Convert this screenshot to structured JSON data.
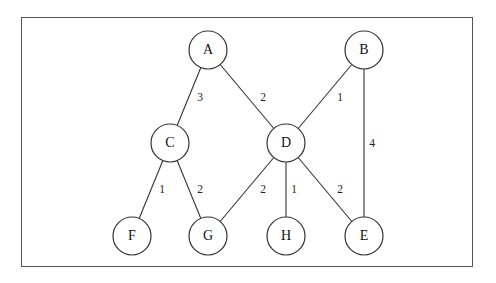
{
  "diagram": {
    "type": "weighted-undirected-graph",
    "nodes": [
      {
        "id": "A",
        "label": "A",
        "x": 208,
        "y": 50
      },
      {
        "id": "B",
        "label": "B",
        "x": 364,
        "y": 50
      },
      {
        "id": "C",
        "label": "C",
        "x": 170,
        "y": 143
      },
      {
        "id": "D",
        "label": "D",
        "x": 286,
        "y": 143
      },
      {
        "id": "F",
        "label": "F",
        "x": 132,
        "y": 236
      },
      {
        "id": "G",
        "label": "G",
        "x": 208,
        "y": 236
      },
      {
        "id": "H",
        "label": "H",
        "x": 286,
        "y": 236
      },
      {
        "id": "E",
        "label": "E",
        "x": 364,
        "y": 236
      }
    ],
    "edges": [
      {
        "from": "A",
        "to": "C",
        "weight": "3",
        "lx": 200,
        "ly": 98
      },
      {
        "from": "A",
        "to": "D",
        "weight": "2",
        "lx": 263,
        "ly": 98
      },
      {
        "from": "B",
        "to": "D",
        "weight": "1",
        "lx": 340,
        "ly": 98
      },
      {
        "from": "B",
        "to": "E",
        "weight": "4",
        "lx": 372,
        "ly": 144
      },
      {
        "from": "C",
        "to": "F",
        "weight": "1",
        "lx": 162,
        "ly": 190
      },
      {
        "from": "C",
        "to": "G",
        "weight": "2",
        "lx": 200,
        "ly": 190
      },
      {
        "from": "D",
        "to": "G",
        "weight": "2",
        "lx": 263,
        "ly": 190
      },
      {
        "from": "D",
        "to": "H",
        "weight": "1",
        "lx": 294,
        "ly": 190
      },
      {
        "from": "D",
        "to": "E",
        "weight": "2",
        "lx": 340,
        "ly": 190
      }
    ],
    "node_radius": 19
  }
}
